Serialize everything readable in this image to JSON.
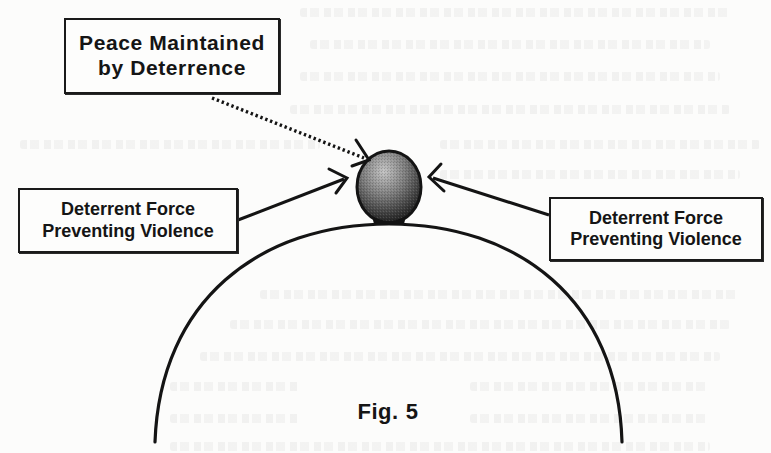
{
  "figure": {
    "caption_label": "Fig.",
    "caption_number": "5"
  },
  "boxes": {
    "top": {
      "line1": "Peace Maintained",
      "line2": "by Deterrence"
    },
    "left": {
      "line1": "Deterrent Force",
      "line2": "Preventing Violence"
    },
    "right": {
      "line1": "Deterrent Force",
      "line2": "Preventing Violence"
    }
  },
  "elements": {
    "ball": "sphere balanced on top of hill (shaded gradient)",
    "hill": "semicircular arc representing unstable equilibrium",
    "arrows": [
      {
        "from": "top",
        "to": "ball",
        "style": "dotted"
      },
      {
        "from": "left",
        "to": "ball",
        "style": "solid"
      },
      {
        "from": "right",
        "to": "ball",
        "style": "solid"
      }
    ]
  },
  "colors": {
    "ink": "#161616",
    "paper": "#fcfcfb",
    "ball_light": "#b8b8b8",
    "ball_dark": "#1e1e1e"
  }
}
